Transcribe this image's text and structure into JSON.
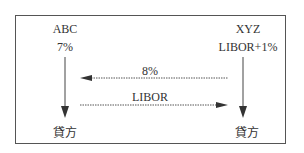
{
  "diagram": {
    "left_party": {
      "name": "ABC",
      "rate": "7%",
      "lender": "貸方"
    },
    "right_party": {
      "name": "XYZ",
      "rate": "LIBOR+1%",
      "lender": "貸方"
    },
    "flows": [
      {
        "label": "8%",
        "direction": "right-to-left"
      },
      {
        "label": "LIBOR",
        "direction": "left-to-right"
      }
    ]
  }
}
